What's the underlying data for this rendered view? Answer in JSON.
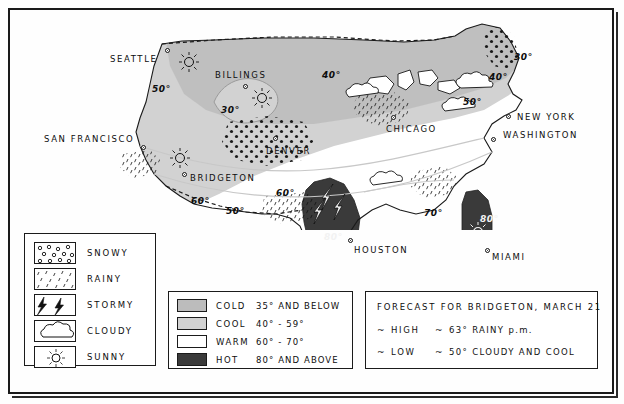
{
  "map": {
    "title": "US weather forecast map",
    "cities": [
      {
        "name": "SEATTLE",
        "label_x": 96,
        "label_y": 42,
        "dot_x": 151,
        "dot_y": 36
      },
      {
        "name": "BILLINGS",
        "label_x": 201,
        "label_y": 58,
        "dot_x": 228,
        "dot_y": 72
      },
      {
        "name": "DENVER",
        "label_x": 255,
        "label_y": 133,
        "dot_x": 262,
        "dot_y": 124
      },
      {
        "name": "SAN FRANCISCO",
        "label_x": 32,
        "label_y": 122,
        "dot_x": 127,
        "dot_y": 133
      },
      {
        "name": "BRIDGETON",
        "label_x": 176,
        "label_y": 161,
        "dot_x": 168,
        "dot_y": 159
      },
      {
        "name": "CHICAGO",
        "label_x": 379,
        "label_y": 112,
        "dot_x": 379,
        "dot_y": 104
      },
      {
        "name": "NEW YORK",
        "label_x": 505,
        "label_y": 100,
        "dot_x": 493,
        "dot_y": 102
      },
      {
        "name": "WASHINGTON",
        "label_x": 491,
        "label_y": 117,
        "dot_x": 478,
        "dot_y": 124
      },
      {
        "name": "HOUSTON",
        "label_x": 349,
        "label_y": 238,
        "dot_x": 345,
        "dot_y": 228
      },
      {
        "name": "MIAMI",
        "label_x": 482,
        "label_y": 243,
        "dot_x": 476,
        "dot_y": 237
      }
    ],
    "temperatures": [
      {
        "value": "50°",
        "x": 141,
        "y": 75
      },
      {
        "value": "30°",
        "x": 210,
        "y": 96
      },
      {
        "value": "40°",
        "x": 311,
        "y": 61
      },
      {
        "value": "30°",
        "x": 503,
        "y": 42
      },
      {
        "value": "40°",
        "x": 478,
        "y": 62
      },
      {
        "value": "50°",
        "x": 452,
        "y": 87
      },
      {
        "value": "60°",
        "x": 180,
        "y": 186
      },
      {
        "value": "50°",
        "x": 215,
        "y": 196
      },
      {
        "value": "60°",
        "x": 265,
        "y": 178
      },
      {
        "value": "70°",
        "x": 413,
        "y": 198
      },
      {
        "value": "80°",
        "x": 316,
        "y": 241
      },
      {
        "value": "80°",
        "x": 472,
        "y": 220
      }
    ]
  },
  "symbol_legend": {
    "title": "weather symbols",
    "items": [
      {
        "label": "SNOWY",
        "icon": "snow-swatch-icon"
      },
      {
        "label": "RAINY",
        "icon": "rain-swatch-icon"
      },
      {
        "label": "STORMY",
        "icon": "storm-swatch-icon"
      },
      {
        "label": "CLOUDY",
        "icon": "cloud-swatch-icon"
      },
      {
        "label": "SUNNY",
        "icon": "sun-swatch-icon"
      }
    ]
  },
  "temperature_legend": {
    "items": [
      {
        "name": "COLD",
        "range": "35° AND BELOW",
        "color": "#bcbcbc"
      },
      {
        "name": "COOL",
        "range": "40° - 59°",
        "color": "#d2d2d2"
      },
      {
        "name": "WARM",
        "range": "60° - 70°",
        "color": "#ffffff"
      },
      {
        "name": "HOT",
        "range": "80° AND ABOVE",
        "color": "#3a3a3a"
      }
    ]
  },
  "forecast": {
    "title": "FORECAST FOR BRIDGETON, MARCH 21",
    "rows": [
      {
        "tilde": "~",
        "key": "HIGH",
        "sep": "~",
        "value": "63° RAINY p.m."
      },
      {
        "tilde": "~",
        "key": "LOW",
        "sep": "~",
        "value": "50° CLOUDY AND COOL"
      }
    ]
  },
  "colors": {
    "cold": "#bcbcbc",
    "cool": "#d2d2d2",
    "warm": "#ffffff",
    "hot": "#3a3a3a",
    "ink": "#111111",
    "paper": "#fefefe"
  }
}
